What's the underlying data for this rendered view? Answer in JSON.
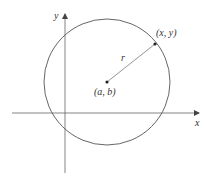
{
  "diagram": {
    "axes": {
      "x_label": "x",
      "y_label": "y"
    },
    "circle": {
      "center_label": "(a, b)",
      "radius_label": "r",
      "point_label": "(x, y)"
    },
    "colors": {
      "stroke": "#555555",
      "text": "#333333",
      "background": "#ffffff"
    }
  }
}
